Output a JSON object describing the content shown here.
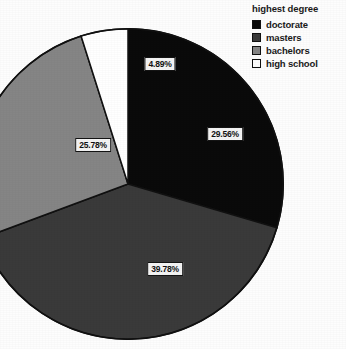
{
  "legend": {
    "title": "highest degree",
    "items": [
      {
        "label": "doctorate",
        "color": "#0a0a0a"
      },
      {
        "label": "masters",
        "color": "#3a3a3a"
      },
      {
        "label": "bachelors",
        "color": "#858585"
      },
      {
        "label": "high school",
        "color": "#ffffff"
      }
    ]
  },
  "labels": {
    "doctorate": "29.56%",
    "masters": "39.78%",
    "bachelors": "25.78%",
    "high_school": "4.89%"
  },
  "chart_data": {
    "type": "pie",
    "title": "",
    "legend_title": "highest degree",
    "legend_position": "top-right",
    "categories": [
      "doctorate",
      "masters",
      "bachelors",
      "high school"
    ],
    "values": [
      29.56,
      39.78,
      25.78,
      4.89
    ],
    "value_labels": [
      "29.56%",
      "39.78%",
      "25.78%",
      "4.89%"
    ],
    "units": "percent",
    "total": 100.01,
    "start_angle_deg": 0,
    "direction": "clockwise",
    "slice_colors": [
      "#0a0a0a",
      "#3a3a3a",
      "#858585",
      "#ffffff"
    ],
    "slice_outline_color": "#111111",
    "background": "#ffffff",
    "grid": false
  }
}
